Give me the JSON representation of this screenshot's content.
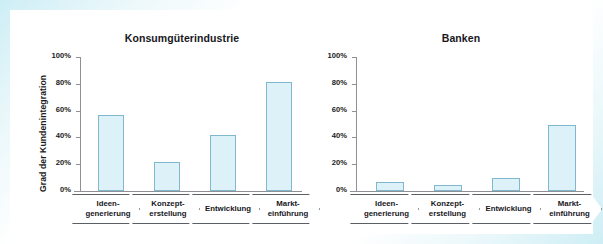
{
  "figure": {
    "frame_color": "#cdeef5",
    "background": "#ffffff"
  },
  "style": {
    "bar_fill": "#dcf2f8",
    "bar_stroke": "#7fb8cc",
    "axis_color": "#8d9095",
    "text_color": "#17171c"
  },
  "charts": [
    {
      "id": "konsumgueterindustrie",
      "title": "Konsumgüterindustrie",
      "ylabel": "Grad der Kundenintegration",
      "yticks": [
        "100%",
        "80%",
        "60%",
        "40%",
        "20%",
        "0%"
      ],
      "stages": [
        {
          "line1": "Ideen-",
          "line2": "generierung"
        },
        {
          "line1": "Konzept-",
          "line2": "erstellung"
        },
        {
          "line1": "Entwicklung",
          "line2": ""
        },
        {
          "line1": "Markt-",
          "line2": "einführung"
        }
      ]
    },
    {
      "id": "banken",
      "title": "Banken",
      "ylabel": "",
      "yticks": [
        "100%",
        "80%",
        "60%",
        "40%",
        "20%",
        "0%"
      ],
      "stages": [
        {
          "line1": "Ideen-",
          "line2": "generierung"
        },
        {
          "line1": "Konzept-",
          "line2": "erstellung"
        },
        {
          "line1": "Entwicklung",
          "line2": ""
        },
        {
          "line1": "Markt-",
          "line2": "einführung"
        }
      ]
    }
  ],
  "chart_data": [
    {
      "type": "bar",
      "title": "Konsumgüterindustrie",
      "xlabel": "",
      "ylabel": "Grad der Kundenintegration",
      "categories": [
        "Ideengenerierung",
        "Konzepterstellung",
        "Entwicklung",
        "Markteinführung"
      ],
      "values": [
        57,
        22,
        42,
        81
      ],
      "ylim": [
        0,
        100
      ],
      "yticks": [
        0,
        20,
        40,
        60,
        80,
        100
      ],
      "ytick_labels": [
        "0%",
        "20%",
        "40%",
        "60%",
        "80%",
        "100%"
      ],
      "grid": false,
      "legend": "none"
    },
    {
      "type": "bar",
      "title": "Banken",
      "xlabel": "",
      "ylabel": "",
      "categories": [
        "Ideengenerierung",
        "Konzepterstellung",
        "Entwicklung",
        "Markteinführung"
      ],
      "values": [
        7,
        4.5,
        10,
        49
      ],
      "ylim": [
        0,
        100
      ],
      "yticks": [
        0,
        20,
        40,
        60,
        80,
        100
      ],
      "ytick_labels": [
        "0%",
        "20%",
        "40%",
        "60%",
        "80%",
        "100%"
      ],
      "grid": false,
      "legend": "none"
    }
  ]
}
